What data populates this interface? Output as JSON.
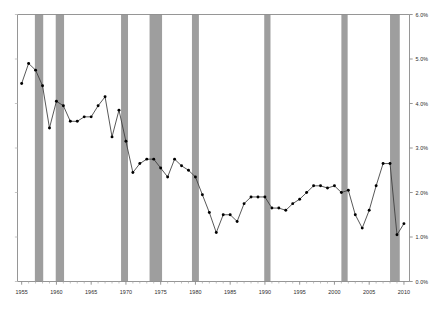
{
  "chart_data": {
    "type": "line",
    "title": "",
    "subtitle": "",
    "xlabel": "",
    "ylabel": "",
    "xlim": [
      1954.4,
      2010.8
    ],
    "ylim": [
      0.0,
      6.0
    ],
    "grid": false,
    "legend": "none",
    "y_tick_format": "percent",
    "y_ticks": [
      "0.0%",
      "1.0%",
      "2.0%",
      "3.0%",
      "4.0%",
      "5.0%",
      "6.0%"
    ],
    "y_tick_values": [
      0.0,
      1.0,
      2.0,
      3.0,
      4.0,
      5.0,
      6.0
    ],
    "y_axis_position": "right",
    "x_ticks": [
      "1955",
      "1960",
      "1965",
      "1970",
      "1975",
      "1980",
      "1985",
      "1990",
      "1995",
      "2000",
      "2005",
      "2010"
    ],
    "x_tick_values": [
      1955,
      1960,
      1965,
      1970,
      1975,
      1980,
      1985,
      1990,
      1995,
      2000,
      2005,
      2010
    ],
    "x_minor_ticks": [
      1956,
      1957,
      1958,
      1959,
      1961,
      1962,
      1963,
      1964,
      1966,
      1967,
      1968,
      1969,
      1971,
      1972,
      1973,
      1974,
      1976,
      1977,
      1978,
      1979,
      1981,
      1982,
      1983,
      1984,
      1986,
      1987,
      1988,
      1989,
      1991,
      1992,
      1993,
      1994,
      1996,
      1997,
      1998,
      1999,
      2001,
      2002,
      2003,
      2004,
      2006,
      2007,
      2008,
      2009
    ],
    "series": [
      {
        "name": "series-1",
        "marker": "filled-circle",
        "line_color": "#3a3a3a",
        "marker_color": "#000000",
        "x": [
          1955,
          1956,
          1957,
          1958,
          1959,
          1960,
          1961,
          1962,
          1963,
          1964,
          1965,
          1966,
          1967,
          1968,
          1969,
          1970,
          1971,
          1972,
          1973,
          1974,
          1975,
          1976,
          1977,
          1978,
          1979,
          1980,
          1981,
          1982,
          1983,
          1984,
          1985,
          1986,
          1987,
          1988,
          1989,
          1990,
          1991,
          1992,
          1993,
          1994,
          1995,
          1996,
          1997,
          1998,
          1999,
          2000,
          2001,
          2002,
          2003,
          2004,
          2005,
          2006,
          2007,
          2008,
          2009,
          2010
        ],
        "values": [
          4.45,
          4.9,
          4.75,
          4.4,
          3.45,
          4.05,
          3.95,
          3.6,
          3.6,
          3.7,
          3.7,
          3.95,
          4.15,
          3.25,
          3.85,
          3.15,
          2.45,
          2.65,
          2.75,
          2.75,
          2.55,
          2.35,
          2.75,
          2.6,
          2.5,
          2.35,
          1.95,
          1.55,
          1.1,
          1.5,
          1.5,
          1.35,
          1.75,
          1.9,
          1.9,
          1.9,
          1.65,
          1.65,
          1.6,
          1.75,
          1.85,
          2.0,
          2.15,
          2.15,
          2.1,
          2.15,
          2.0,
          2.05,
          1.5,
          1.2,
          1.6,
          2.15,
          2.65,
          2.65,
          1.05,
          1.3
        ]
      }
    ],
    "recession_bands": {
      "label": "recession-band",
      "color": "#9e9e9e",
      "opacity": 1,
      "spans": [
        {
          "start": 1956.9,
          "end": 1958.1
        },
        {
          "start": 1959.9,
          "end": 1961.1
        },
        {
          "start": 1969.3,
          "end": 1970.3
        },
        {
          "start": 1973.4,
          "end": 1975.2
        },
        {
          "start": 1979.5,
          "end": 1980.5
        },
        {
          "start": 1989.9,
          "end": 1990.8
        },
        {
          "start": 2001.0,
          "end": 2001.9
        },
        {
          "start": 2008.0,
          "end": 2009.4
        }
      ]
    },
    "axis_color": "#8a8a8a",
    "background_color": "#ffffff"
  }
}
